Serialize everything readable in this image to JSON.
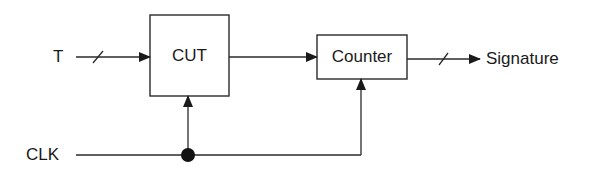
{
  "diagram": {
    "inputs": {
      "test_input": "T",
      "clock": "CLK"
    },
    "blocks": {
      "cut": "CUT",
      "counter": "Counter"
    },
    "outputs": {
      "signature": "Signature"
    },
    "edges": [
      {
        "from": "T",
        "to": "CUT",
        "bus": true
      },
      {
        "from": "CUT",
        "to": "Counter",
        "bus": false
      },
      {
        "from": "Counter",
        "to": "Signature",
        "bus": true
      },
      {
        "from": "CLK",
        "to": "CUT",
        "bus": false
      },
      {
        "from": "CLK",
        "to": "Counter",
        "bus": false
      }
    ],
    "colors": {
      "stroke": "#2a2a2a",
      "background": "#ffffff"
    }
  }
}
